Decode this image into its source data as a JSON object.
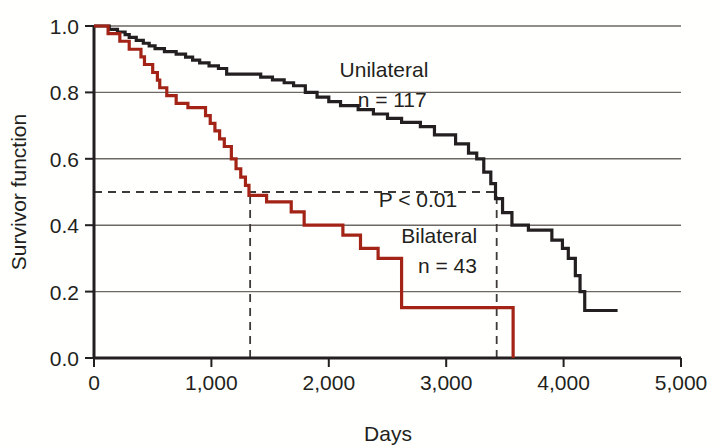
{
  "chart_data": {
    "type": "line",
    "subtype": "kaplan-meier-step",
    "title": "",
    "xlabel": "Days",
    "ylabel": "Survivor function",
    "xlim": [
      0,
      5000
    ],
    "ylim": [
      0.0,
      1.0
    ],
    "xticks": [
      0,
      1000,
      2000,
      3000,
      4000,
      5000
    ],
    "xtick_labels": [
      "0",
      "1,000",
      "2,000",
      "3,000",
      "4,000",
      "5,000"
    ],
    "yticks": [
      0.0,
      0.2,
      0.4,
      0.6,
      0.8,
      1.0
    ],
    "ytick_labels": [
      "0.0",
      "0.2",
      "0.4",
      "0.6",
      "0.8",
      "1.0"
    ],
    "grid": "horizontal",
    "legend_position": "inline-annotations",
    "series": [
      {
        "name": "Unilateral",
        "label": "Unilateral",
        "n_label": "n = 117",
        "n": 117,
        "color": "#231f20",
        "median_survival_days": 3430,
        "points": [
          [
            0,
            1.0
          ],
          [
            130,
            1.0
          ],
          [
            130,
            0.99
          ],
          [
            200,
            0.99
          ],
          [
            200,
            0.982
          ],
          [
            265,
            0.982
          ],
          [
            265,
            0.974
          ],
          [
            300,
            0.974
          ],
          [
            300,
            0.966
          ],
          [
            360,
            0.966
          ],
          [
            360,
            0.957
          ],
          [
            420,
            0.957
          ],
          [
            420,
            0.948
          ],
          [
            470,
            0.948
          ],
          [
            470,
            0.94
          ],
          [
            520,
            0.94
          ],
          [
            520,
            0.932
          ],
          [
            600,
            0.932
          ],
          [
            600,
            0.923
          ],
          [
            700,
            0.923
          ],
          [
            700,
            0.915
          ],
          [
            780,
            0.915
          ],
          [
            780,
            0.906
          ],
          [
            840,
            0.906
          ],
          [
            840,
            0.897
          ],
          [
            900,
            0.897
          ],
          [
            900,
            0.889
          ],
          [
            980,
            0.889
          ],
          [
            980,
            0.88
          ],
          [
            1060,
            0.88
          ],
          [
            1060,
            0.872
          ],
          [
            1130,
            0.872
          ],
          [
            1130,
            0.855
          ],
          [
            1420,
            0.855
          ],
          [
            1420,
            0.846
          ],
          [
            1520,
            0.846
          ],
          [
            1520,
            0.838
          ],
          [
            1620,
            0.838
          ],
          [
            1620,
            0.829
          ],
          [
            1700,
            0.829
          ],
          [
            1700,
            0.82
          ],
          [
            1800,
            0.82
          ],
          [
            1800,
            0.8
          ],
          [
            1900,
            0.8
          ],
          [
            1900,
            0.786
          ],
          [
            2000,
            0.786
          ],
          [
            2000,
            0.772
          ],
          [
            2100,
            0.772
          ],
          [
            2100,
            0.76
          ],
          [
            2250,
            0.76
          ],
          [
            2250,
            0.748
          ],
          [
            2380,
            0.748
          ],
          [
            2380,
            0.735
          ],
          [
            2500,
            0.735
          ],
          [
            2500,
            0.722
          ],
          [
            2620,
            0.722
          ],
          [
            2620,
            0.71
          ],
          [
            2780,
            0.71
          ],
          [
            2780,
            0.697
          ],
          [
            2900,
            0.697
          ],
          [
            2900,
            0.672
          ],
          [
            3080,
            0.672
          ],
          [
            3080,
            0.645
          ],
          [
            3190,
            0.645
          ],
          [
            3190,
            0.617
          ],
          [
            3260,
            0.617
          ],
          [
            3260,
            0.6
          ],
          [
            3320,
            0.6
          ],
          [
            3320,
            0.56
          ],
          [
            3380,
            0.56
          ],
          [
            3380,
            0.525
          ],
          [
            3420,
            0.525
          ],
          [
            3420,
            0.48
          ],
          [
            3480,
            0.48
          ],
          [
            3480,
            0.438
          ],
          [
            3560,
            0.438
          ],
          [
            3560,
            0.4
          ],
          [
            3700,
            0.4
          ],
          [
            3700,
            0.385
          ],
          [
            3900,
            0.385
          ],
          [
            3900,
            0.355
          ],
          [
            3990,
            0.355
          ],
          [
            3990,
            0.33
          ],
          [
            4040,
            0.33
          ],
          [
            4040,
            0.3
          ],
          [
            4100,
            0.3
          ],
          [
            4100,
            0.248
          ],
          [
            4140,
            0.248
          ],
          [
            4140,
            0.2
          ],
          [
            4180,
            0.2
          ],
          [
            4180,
            0.143
          ],
          [
            4460,
            0.143
          ]
        ]
      },
      {
        "name": "Bilateral",
        "label": "Bilateral",
        "n_label": "n = 43",
        "n": 43,
        "color": "#a32417",
        "median_survival_days": 1330,
        "points": [
          [
            0,
            1.0
          ],
          [
            120,
            1.0
          ],
          [
            120,
            0.977
          ],
          [
            220,
            0.977
          ],
          [
            220,
            0.954
          ],
          [
            300,
            0.954
          ],
          [
            300,
            0.93
          ],
          [
            400,
            0.93
          ],
          [
            400,
            0.907
          ],
          [
            430,
            0.907
          ],
          [
            430,
            0.884
          ],
          [
            500,
            0.884
          ],
          [
            500,
            0.86
          ],
          [
            540,
            0.86
          ],
          [
            540,
            0.837
          ],
          [
            560,
            0.837
          ],
          [
            560,
            0.814
          ],
          [
            620,
            0.814
          ],
          [
            620,
            0.79
          ],
          [
            700,
            0.79
          ],
          [
            700,
            0.767
          ],
          [
            800,
            0.767
          ],
          [
            800,
            0.754
          ],
          [
            950,
            0.754
          ],
          [
            950,
            0.73
          ],
          [
            990,
            0.73
          ],
          [
            990,
            0.707
          ],
          [
            1030,
            0.707
          ],
          [
            1030,
            0.684
          ],
          [
            1070,
            0.684
          ],
          [
            1070,
            0.66
          ],
          [
            1110,
            0.66
          ],
          [
            1110,
            0.637
          ],
          [
            1170,
            0.637
          ],
          [
            1170,
            0.6
          ],
          [
            1210,
            0.6
          ],
          [
            1210,
            0.57
          ],
          [
            1250,
            0.57
          ],
          [
            1250,
            0.545
          ],
          [
            1290,
            0.545
          ],
          [
            1290,
            0.52
          ],
          [
            1320,
            0.52
          ],
          [
            1320,
            0.49
          ],
          [
            1470,
            0.49
          ],
          [
            1470,
            0.47
          ],
          [
            1680,
            0.47
          ],
          [
            1680,
            0.44
          ],
          [
            1790,
            0.44
          ],
          [
            1790,
            0.4
          ],
          [
            2120,
            0.4
          ],
          [
            2120,
            0.37
          ],
          [
            2270,
            0.37
          ],
          [
            2270,
            0.33
          ],
          [
            2420,
            0.33
          ],
          [
            2420,
            0.3
          ],
          [
            2620,
            0.3
          ],
          [
            2620,
            0.152
          ],
          [
            3570,
            0.152
          ],
          [
            3570,
            0.0
          ]
        ]
      }
    ],
    "annotations": [
      {
        "id": "unilateral-label",
        "text": "Unilateral",
        "x_days": 2470,
        "y_value": 0.845
      },
      {
        "id": "unilateral-n",
        "text": "n = 117",
        "x_days": 2540,
        "y_value": 0.755
      },
      {
        "id": "p-value",
        "text": "P < 0.01",
        "x_days": 2760,
        "y_value": 0.455
      },
      {
        "id": "bilateral-label",
        "text": "Bilateral",
        "x_days": 2940,
        "y_value": 0.345
      },
      {
        "id": "bilateral-n",
        "text": "n = 43",
        "x_days": 3010,
        "y_value": 0.255
      }
    ],
    "reference_lines": [
      {
        "id": "median-horizontal",
        "orientation": "horizontal",
        "value": 0.5,
        "style": "dashed",
        "from_x": 0,
        "to_x": 3430
      },
      {
        "id": "bilateral-median-vertical",
        "orientation": "vertical",
        "value": 1330,
        "style": "dashed",
        "from_y": 0.0,
        "to_y": 0.5
      },
      {
        "id": "unilateral-median-vertical",
        "orientation": "vertical",
        "value": 3430,
        "style": "dashed",
        "from_y": 0.0,
        "to_y": 0.5
      }
    ],
    "colors": {
      "unilateral": "#231f20",
      "bilateral": "#a32417",
      "grid": "#6d6863",
      "axis": "#231f20",
      "background": "#fffffd"
    }
  }
}
